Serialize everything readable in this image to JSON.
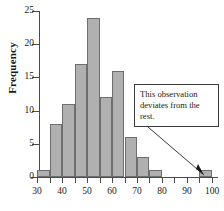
{
  "chart_data": {
    "type": "bar",
    "title": "",
    "xlabel": "",
    "ylabel": "Frequency",
    "xlim": [
      27.5,
      102.5
    ],
    "ylim": [
      0,
      25
    ],
    "grid": false,
    "legend": null,
    "bin_width": 5,
    "bins": [
      {
        "start": 30,
        "end": 35,
        "value": 1
      },
      {
        "start": 35,
        "end": 40,
        "value": 8
      },
      {
        "start": 40,
        "end": 45,
        "value": 11
      },
      {
        "start": 45,
        "end": 50,
        "value": 17
      },
      {
        "start": 50,
        "end": 55,
        "value": 24
      },
      {
        "start": 55,
        "end": 60,
        "value": 12
      },
      {
        "start": 60,
        "end": 65,
        "value": 16
      },
      {
        "start": 65,
        "end": 70,
        "value": 6
      },
      {
        "start": 70,
        "end": 75,
        "value": 3
      },
      {
        "start": 75,
        "end": 80,
        "value": 1
      },
      {
        "start": 95,
        "end": 100,
        "value": 1
      }
    ],
    "categories": [
      "30-35",
      "35-40",
      "40-45",
      "45-50",
      "50-55",
      "55-60",
      "60-65",
      "65-70",
      "70-75",
      "75-80",
      "95-100"
    ],
    "values": [
      1,
      8,
      11,
      17,
      24,
      12,
      16,
      6,
      3,
      1,
      1
    ],
    "y_ticks": [
      0,
      5,
      10,
      15,
      20,
      25
    ],
    "y_tick_labels": [
      "0",
      "5",
      "10",
      "15",
      "20",
      "25"
    ],
    "x_major_ticks": [
      30,
      40,
      50,
      60,
      70,
      80,
      90,
      100
    ],
    "x_major_tick_labels": [
      "30",
      "40",
      "50",
      "60",
      "70",
      "80",
      "90",
      "100"
    ],
    "x_minor_ticks": [
      35,
      45,
      55,
      65,
      75,
      85,
      95
    ],
    "annotations": [
      {
        "text": "This observation deviates from the rest.",
        "points_to_bin": "95-100",
        "points_to_value": 1
      }
    ],
    "colors": {
      "bar_fill": "#b0b0b0",
      "bar_border": "#6e6e6e",
      "axis": "#4a4a4a",
      "text": "#1a1a1a",
      "annotation_border": "#3a3a3a",
      "annotation_background": "#ffffff",
      "background": "#ffffff"
    }
  }
}
